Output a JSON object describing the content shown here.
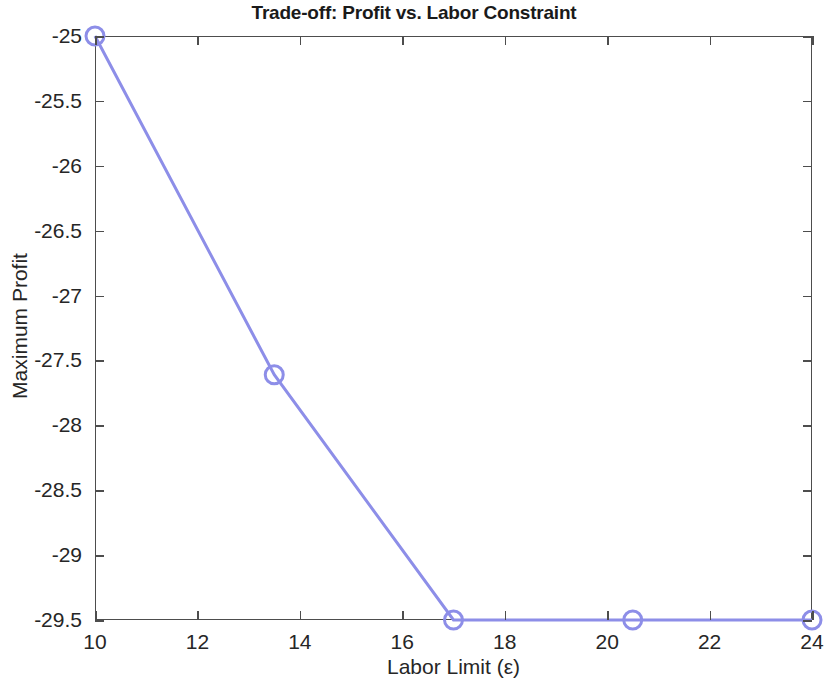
{
  "chart_data": {
    "type": "line",
    "title": "Trade-off: Profit vs. Labor Constraint",
    "xlabel": "Labor Limit (ε)",
    "ylabel": "Maximum Profit",
    "x": [
      10,
      13.5,
      17,
      20.5,
      24
    ],
    "values": [
      -25,
      -27.61,
      -29.5,
      -29.5,
      -29.5
    ],
    "series": [
      {
        "name": "Maximum Profit",
        "x": [
          10,
          13.5,
          17,
          20.5,
          24
        ],
        "values": [
          -25,
          -27.61,
          -29.5,
          -29.5,
          -29.5
        ]
      }
    ],
    "xlim": [
      10,
      24
    ],
    "ylim": [
      -29.5,
      -25
    ],
    "xticks": [
      10,
      12,
      14,
      16,
      18,
      20,
      22,
      24
    ],
    "xticklabels": [
      "10",
      "12",
      "14",
      "16",
      "18",
      "20",
      "22",
      "24"
    ],
    "yticks": [
      -29.5,
      -29,
      -28.5,
      -28,
      -27.5,
      -27,
      -26.5,
      -26,
      -25.5,
      -25
    ],
    "yticklabels": [
      "-29.5",
      "-29",
      "-28.5",
      "-28",
      "-27.5",
      "-27",
      "-26.5",
      "-26",
      "-25.5",
      "-25"
    ],
    "grid": false,
    "legend": null,
    "marker": "circle",
    "line_color": "#8d8ee8",
    "marker_color": "#8d8ee8",
    "axis_color": "#4d4d4d",
    "background_color": "#ffffff"
  }
}
